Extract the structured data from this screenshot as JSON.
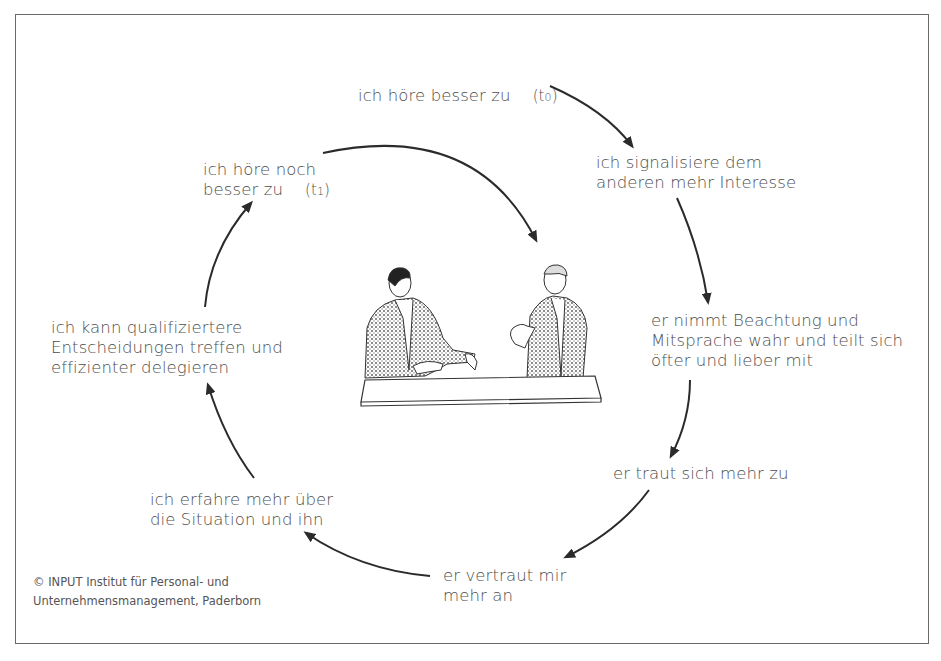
{
  "diagram": {
    "type": "cycle",
    "nodes": [
      {
        "id": "n1",
        "lines": [
          "ich höre besser zu"
        ],
        "time_label": "(t",
        "time_sub": "0",
        "time_close": ")"
      },
      {
        "id": "n2",
        "lines": [
          "ich signalisiere dem",
          "anderen mehr Interesse"
        ]
      },
      {
        "id": "n3",
        "lines": [
          "er nimmt Beachtung und",
          "Mitsprache wahr und teilt sich",
          "öfter und lieber mit"
        ]
      },
      {
        "id": "n4",
        "lines": [
          "er traut sich mehr zu"
        ]
      },
      {
        "id": "n5",
        "lines": [
          "er vertraut mir",
          "mehr an"
        ]
      },
      {
        "id": "n6",
        "lines": [
          "ich erfahre mehr über",
          "die Situation und ihn"
        ]
      },
      {
        "id": "n7",
        "lines": [
          "ich kann qualifiziertere",
          "Entscheidungen treffen und",
          "effizienter delegieren"
        ]
      },
      {
        "id": "n8",
        "lines": [
          "ich höre noch",
          "besser zu"
        ],
        "time_label": "(t",
        "time_sub": "1",
        "time_close": ")"
      }
    ],
    "edges": [
      [
        "n1",
        "n2"
      ],
      [
        "n2",
        "n3"
      ],
      [
        "n3",
        "n4"
      ],
      [
        "n4",
        "n5"
      ],
      [
        "n5",
        "n6"
      ],
      [
        "n6",
        "n7"
      ],
      [
        "n7",
        "n8"
      ],
      [
        "n8",
        "center-illustration"
      ]
    ],
    "center_image": "two-businessmen-talking-at-table",
    "colors": {
      "text": "#4d4d4d",
      "arrow": "#2b2b2b",
      "frame": "#6a6a6a"
    }
  },
  "copyright": {
    "line1": "© INPUT Institut für Personal- und",
    "line2": "Unternehmensmanagement, Paderborn"
  }
}
